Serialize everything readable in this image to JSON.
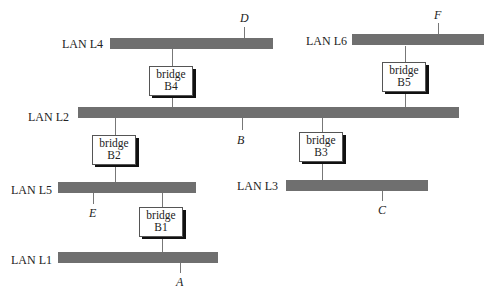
{
  "diagram": {
    "type": "bridged LAN topology",
    "lans": [
      {
        "id": "L4",
        "label": "LAN L4"
      },
      {
        "id": "L6",
        "label": "LAN L6"
      },
      {
        "id": "L2",
        "label": "LAN L2"
      },
      {
        "id": "L5",
        "label": "LAN L5"
      },
      {
        "id": "L3",
        "label": "LAN L3"
      },
      {
        "id": "L1",
        "label": "LAN L1"
      }
    ],
    "bridges": [
      {
        "id": "B4",
        "word": "bridge",
        "name": "B4",
        "connects": [
          "L4",
          "L2"
        ]
      },
      {
        "id": "B5",
        "word": "bridge",
        "name": "B5",
        "connects": [
          "L6",
          "L2"
        ]
      },
      {
        "id": "B2",
        "word": "bridge",
        "name": "B2",
        "connects": [
          "L2",
          "L5"
        ]
      },
      {
        "id": "B3",
        "word": "bridge",
        "name": "B3",
        "connects": [
          "L2",
          "L3"
        ]
      },
      {
        "id": "B1",
        "word": "bridge",
        "name": "B1",
        "connects": [
          "L5",
          "L1"
        ]
      }
    ],
    "hosts": [
      {
        "id": "D",
        "label": "D",
        "lan": "L4"
      },
      {
        "id": "F",
        "label": "F",
        "lan": "L6"
      },
      {
        "id": "B",
        "label": "B",
        "lan": "L2"
      },
      {
        "id": "E",
        "label": "E",
        "lan": "L5"
      },
      {
        "id": "C",
        "label": "C",
        "lan": "L3"
      },
      {
        "id": "A",
        "label": "A",
        "lan": "L1"
      }
    ],
    "colors": {
      "lan_bar": "#6f6f6f",
      "bridge_shadow": "#111111",
      "line": "#777777"
    }
  }
}
